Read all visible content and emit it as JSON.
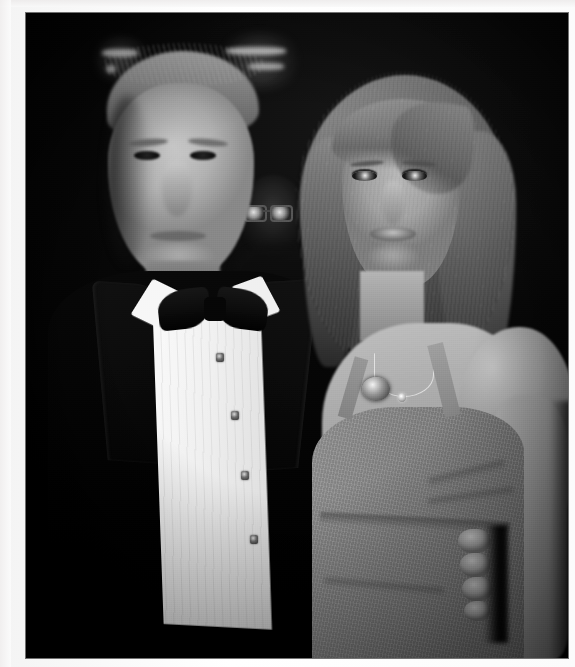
{
  "media": {
    "type": "photograph",
    "orientation": "portrait",
    "color_mode": "black-and-white",
    "width_px": 575,
    "height_px": 667,
    "caption": "Man in black tuxedo with bow tie standing beside a woman in a grey halter-neck dress",
    "setting": "Indoor evening event, dark background with blurred ceiling lights"
  },
  "border": {
    "name": "scan-margin",
    "color": "#ffffff",
    "left_px": 26,
    "top_px": 13,
    "right_px": 7,
    "bottom_px": 9
  },
  "palette": {
    "background_black": "#050505",
    "jacket_black": "#0a0a0a",
    "shirt_white": "#f4f2ee",
    "skin_midtone": "#b4ada0",
    "dress_grey": "#8d8780",
    "hair_highlight": "#b6b1a6",
    "light_flare": "#cfcfcf"
  },
  "subjects": [
    {
      "id": "man",
      "name": "man-in-tuxedo",
      "position": "left",
      "facing": "camera",
      "features": [
        {
          "name": "swept-blond-hair",
          "tone": "light"
        },
        {
          "name": "face",
          "expression": "neutral"
        },
        {
          "name": "black-bow-tie"
        },
        {
          "name": "white-pleated-dress-shirt"
        },
        {
          "name": "black-tuxedo-jacket"
        }
      ],
      "shirt_studs": 4
    },
    {
      "id": "woman",
      "name": "woman-in-dress",
      "position": "right",
      "facing": "camera",
      "features": [
        {
          "name": "long-wavy-hair",
          "tone": "light-brown"
        },
        {
          "name": "face",
          "expression": "neutral"
        },
        {
          "name": "thin-chain-necklace"
        },
        {
          "name": "halter-neck-grey-dress"
        },
        {
          "name": "bare-right-arm"
        },
        {
          "name": "hand-at-waist",
          "fingers_visible": 4
        }
      ]
    },
    {
      "id": "background-person",
      "name": "background-figure-with-glasses",
      "position": "center-background",
      "visibility": "faint"
    }
  ],
  "background_lights": [
    {
      "name": "light-bar-left",
      "x": 76,
      "y": 36,
      "w": 36,
      "h": 8
    },
    {
      "name": "light-dot-left",
      "x": 80,
      "y": 52,
      "w": 10,
      "h": 8
    },
    {
      "name": "light-bar-right-upper",
      "x": 200,
      "y": 34,
      "w": 60,
      "h": 8
    },
    {
      "name": "light-bar-right-lower",
      "x": 222,
      "y": 50,
      "w": 36,
      "h": 7
    }
  ]
}
